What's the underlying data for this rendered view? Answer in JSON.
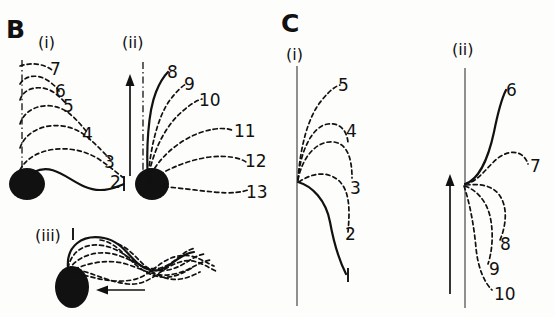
{
  "figure": {
    "caption_present": false,
    "panels": [
      {
        "id": "B",
        "letter": "B",
        "subpanels": [
          {
            "id": "B-i",
            "roman": "(i)",
            "reference_line": "dash-dot-vertical",
            "arrow": "none",
            "cell_body": "filled-oval",
            "solid_trace_label": "1",
            "labels": [
              "7",
              "6",
              "5",
              "4",
              "3",
              "2",
              "1"
            ]
          },
          {
            "id": "B-ii",
            "roman": "(ii)",
            "reference_line": "dash-dot-vertical",
            "arrow": "up",
            "cell_body": "filled-oval",
            "solid_trace_label": "8",
            "labels": [
              "8",
              "9",
              "10",
              "11",
              "12",
              "13"
            ]
          },
          {
            "id": "B-iii",
            "roman": "(iii)",
            "reference_line": "none",
            "arrow": "left",
            "cell_body": "filled-oval",
            "solid_trace_label": "1",
            "labels": []
          }
        ]
      },
      {
        "id": "C",
        "letter": "C",
        "subpanels": [
          {
            "id": "C-i",
            "roman": "(i)",
            "reference_line": "solid-vertical",
            "arrow": "none",
            "cell_body": "none",
            "solid_trace_label": "1",
            "labels": [
              "5",
              "4",
              "3",
              "2",
              "1"
            ]
          },
          {
            "id": "C-ii",
            "roman": "(ii)",
            "reference_line": "solid-vertical",
            "arrow": "up",
            "cell_body": "none",
            "solid_trace_label": "6",
            "labels": [
              "6",
              "7",
              "8",
              "9",
              "10"
            ]
          }
        ]
      }
    ]
  },
  "labels": {
    "panel_b": "B",
    "panel_c": "C",
    "roman_i": "(i)",
    "roman_ii": "(ii)",
    "roman_iii": "(iii)",
    "b_i": {
      "n7": "7",
      "n6": "6",
      "n5": "5",
      "n4": "4",
      "n3": "3",
      "n2": "2",
      "n1": "1"
    },
    "b_ii": {
      "n8": "8",
      "n9": "9",
      "n10": "10",
      "n11": "11",
      "n12": "12",
      "n13": "13"
    },
    "b_iii": {
      "n1": "1"
    },
    "c_i": {
      "n5": "5",
      "n4": "4",
      "n3": "3",
      "n2": "2",
      "n1": "1"
    },
    "c_ii": {
      "n6": "6",
      "n7": "7",
      "n8": "8",
      "n9": "9",
      "n10": "10"
    }
  },
  "colors": {
    "ink": "#111111",
    "reference_line": "#555555",
    "background": "#fdfdfb"
  }
}
